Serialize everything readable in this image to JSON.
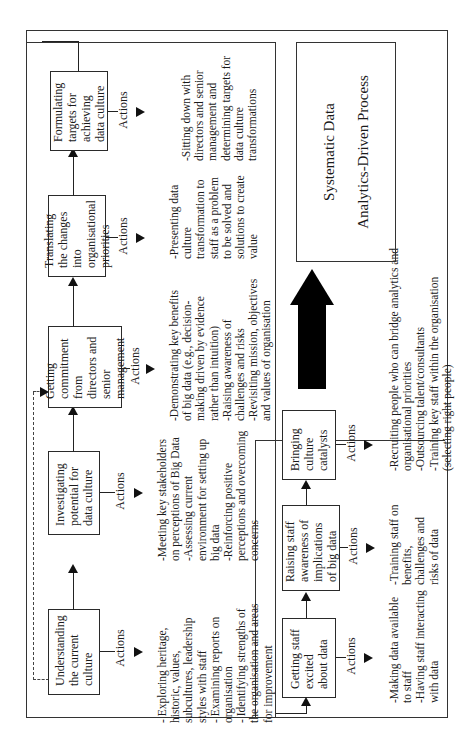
{
  "diagram": {
    "upper_flow": {
      "steps": [
        {
          "label": "Understanding the current culture",
          "actions_label": "Actions",
          "actions": "- Exploring heritage,\nhistoric, values,\nsubcultures, leadership\nstyles with staff\n- Examining reports on\norganisation\n- Identifying strengths of\nthe organisation and areas\nfor improvement"
        },
        {
          "label": "Investigating potential for data culture",
          "actions_label": "Actions",
          "actions": "-Meeting key stakeholders\non perceptions of Big Data\n-Assessing current\nenvironment for setting up\nbig data\n-Reinforcing positive\nperceptions and overcoming\nconcerns"
        },
        {
          "label": "Getting commitment from directors and senior management",
          "actions_label": "Actions",
          "actions": "-Demonstrating key benefits\nof big data (e.g., decision-\nmaking driven by evidence\nrather than intuition)\n-Raising awareness of\nchallenges and risks\n-Revisiting mission, objectives\nand values of organisation"
        },
        {
          "label": "Translating the changes into organisational priorities",
          "actions_label": "Actions",
          "actions": "-Presenting data\nculture\ntransformation to\nstaff as a problem\nto be solved and\nsolutions to create\nvalue"
        },
        {
          "label": "Formulating targets for achieving data culture",
          "actions_label": "Actions",
          "actions": "-Sitting down with\ndirectors and senior\nmanagement and\ndetermining targets for\ndata culture\ntransformations"
        }
      ]
    },
    "lower_flow": {
      "steps": [
        {
          "label": "Getting staff excited about data",
          "actions_label": "Actions",
          "actions": "-Making data available\nto staff\n-Having staff interacting\nwith data"
        },
        {
          "label": "Raising staff awareness of implications of big data",
          "actions_label": "Actions",
          "actions": "-Training staff on\nbenefits,\nchallenges and\nrisks of data"
        },
        {
          "label": "Bringing culture catalysts",
          "actions_label": "Actions",
          "actions": "-Recruiting people who can bridge analytics and\norganisational priorities\n-Outsourcing talent/consultants\n-Training key staff within the organisation\n(selecting right people)"
        }
      ]
    },
    "outcome": {
      "line1": "Systematic Data",
      "line2": "Analytics-Driven Process"
    }
  }
}
